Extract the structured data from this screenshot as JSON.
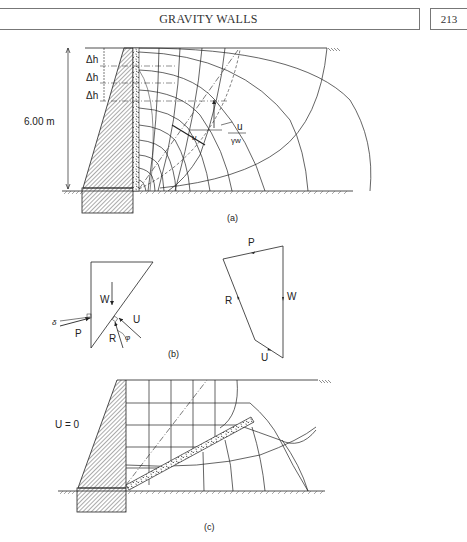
{
  "header": {
    "running_title": "GRAVITY WALLS",
    "page_number": "213"
  },
  "figure": {
    "panel_a": {
      "caption": "(a)",
      "height_label": "6.00 m",
      "delta_h_labels": [
        "Δh",
        "Δh",
        "Δh"
      ],
      "pressure_label_numerator": "u",
      "pressure_label_denominator": "γw",
      "angle_label": "u"
    },
    "panel_b": {
      "caption": "(b)",
      "wedge_labels": {
        "weight": "W",
        "uplift": "U",
        "reaction": "R",
        "thrust": "P",
        "wall_friction": "δ",
        "friction_angle": "φ"
      },
      "force_polygon_labels": {
        "thrust": "P",
        "weight": "W",
        "reaction": "R",
        "uplift": "U"
      }
    },
    "panel_c": {
      "caption": "(c)",
      "pore_pressure_label": "U = 0"
    }
  },
  "colors": {
    "ink": "#222222",
    "hatch": "#444444",
    "frame": "#777777"
  }
}
